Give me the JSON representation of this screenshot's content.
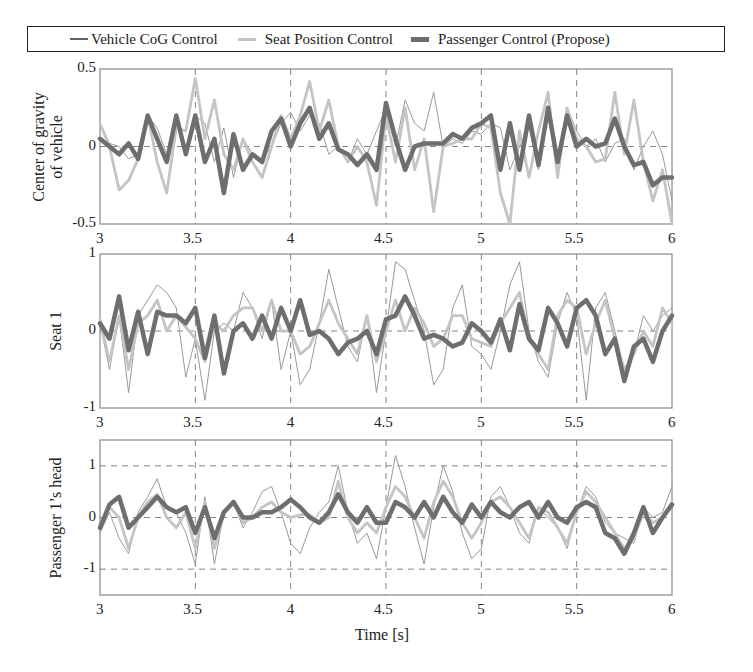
{
  "legend": {
    "items": [
      {
        "label": "Vehicle CoG Control",
        "color": "#909090",
        "width": 1
      },
      {
        "label": "Seat Position Control",
        "color": "#c4c4c4",
        "width": 2.5
      },
      {
        "label": "Passenger Control  (Propose)",
        "color": "#6e6e6e",
        "width": 4.5
      }
    ]
  },
  "chart_data": [
    {
      "type": "line",
      "title": "",
      "xlabel": "",
      "ylabel": "Center of gravity of vehicle",
      "ylabel_lines": [
        "Center of gravity",
        "of vehicle"
      ],
      "xlim": [
        3,
        6
      ],
      "ylim": [
        -0.5,
        0.5
      ],
      "yticks": [
        0.5,
        0,
        -0.5
      ],
      "ytick_labels": [
        "0.5",
        "0",
        "-0.5"
      ],
      "xticks": [
        3,
        3.5,
        4,
        4.5,
        5,
        5.5,
        6
      ],
      "xtick_labels": [
        "3",
        "3.5",
        "4",
        "4.5",
        "5",
        "5.5",
        "6"
      ],
      "hgrid": [
        0
      ],
      "vgrid": [
        3.5,
        4,
        4.5,
        5,
        5.5
      ],
      "x": [
        3.0,
        3.05,
        3.1,
        3.15,
        3.2,
        3.25,
        3.3,
        3.35,
        3.4,
        3.45,
        3.5,
        3.55,
        3.6,
        3.65,
        3.7,
        3.75,
        3.8,
        3.85,
        3.9,
        3.95,
        4.0,
        4.05,
        4.1,
        4.15,
        4.2,
        4.25,
        4.3,
        4.35,
        4.4,
        4.45,
        4.5,
        4.55,
        4.6,
        4.65,
        4.7,
        4.75,
        4.8,
        4.85,
        4.9,
        4.95,
        5.0,
        5.05,
        5.1,
        5.15,
        5.2,
        5.25,
        5.3,
        5.35,
        5.4,
        5.45,
        5.5,
        5.55,
        5.6,
        5.65,
        5.7,
        5.75,
        5.8,
        5.85,
        5.9,
        5.95,
        6.0
      ],
      "series": [
        {
          "name": "Vehicle CoG Control",
          "values": [
            0.15,
            0.02,
            0.0,
            -0.08,
            -0.05,
            0.2,
            0.12,
            -0.05,
            0.2,
            -0.02,
            0.2,
            0.15,
            -0.1,
            0.12,
            -0.2,
            0.05,
            -0.05,
            -0.08,
            0.0,
            0.15,
            0.22,
            0.1,
            0.2,
            0.15,
            -0.05,
            0.0,
            -0.1,
            0.05,
            -0.05,
            0.1,
            0.25,
            0.0,
            0.3,
            0.15,
            0.1,
            0.35,
            0.0,
            0.05,
            0.02,
            0.1,
            0.08,
            0.15,
            0.12,
            -0.15,
            0.0,
            0.12,
            -0.15,
            0.2,
            -0.1,
            0.25,
            0.1,
            0.0,
            0.05,
            -0.1,
            0.02,
            0.05,
            -0.15,
            0.0,
            0.1,
            -0.05,
            -0.35
          ]
        },
        {
          "name": "Seat Position Control",
          "values": [
            0.15,
            0.0,
            -0.28,
            -0.22,
            -0.08,
            0.2,
            -0.1,
            -0.3,
            0.12,
            0.1,
            0.44,
            0.05,
            0.3,
            -0.05,
            -0.15,
            0.05,
            -0.1,
            -0.2,
            0.0,
            0.2,
            0.05,
            0.2,
            0.42,
            0.1,
            0.3,
            0.0,
            -0.1,
            0.0,
            -0.1,
            -0.38,
            0.2,
            -0.1,
            0.25,
            -0.15,
            0.05,
            -0.42,
            0.0,
            0.02,
            0.05,
            0.05,
            0.15,
            0.12,
            -0.3,
            -0.55,
            0.1,
            -0.2,
            0.1,
            0.35,
            -0.2,
            0.25,
            0.05,
            0.0,
            -0.1,
            -0.08,
            0.35,
            -0.05,
            0.3,
            -0.1,
            -0.35,
            -0.15,
            -0.55
          ]
        },
        {
          "name": "Passenger Control (Propose)",
          "values": [
            0.05,
            0.0,
            -0.05,
            0.02,
            -0.08,
            0.2,
            0.05,
            -0.1,
            0.2,
            -0.05,
            0.2,
            -0.1,
            0.05,
            -0.3,
            0.08,
            -0.15,
            -0.05,
            -0.1,
            0.1,
            0.18,
            0.0,
            0.15,
            0.25,
            0.05,
            0.15,
            -0.02,
            -0.05,
            -0.12,
            -0.05,
            -0.15,
            0.28,
            0.05,
            -0.15,
            0.0,
            0.02,
            0.02,
            0.02,
            0.08,
            0.05,
            0.12,
            0.15,
            0.2,
            -0.15,
            0.15,
            -0.15,
            0.2,
            -0.12,
            0.25,
            -0.1,
            0.2,
            0.0,
            0.05,
            0.0,
            0.02,
            0.18,
            0.0,
            -0.12,
            -0.1,
            -0.25,
            -0.2,
            -0.2
          ]
        }
      ]
    },
    {
      "type": "line",
      "title": "",
      "xlabel": "",
      "ylabel": "Seat 1",
      "ylabel_lines": [
        "Seat 1"
      ],
      "xlim": [
        3,
        6
      ],
      "ylim": [
        -1,
        1
      ],
      "yticks": [
        1,
        0,
        -1
      ],
      "ytick_labels": [
        "1",
        "0",
        "-1"
      ],
      "xticks": [
        3,
        3.5,
        4,
        4.5,
        5,
        5.5,
        6
      ],
      "xtick_labels": [
        "3",
        "3.5",
        "4",
        "4.5",
        "5",
        "5.5",
        "6"
      ],
      "hgrid": [
        0
      ],
      "vgrid": [
        3.5,
        4,
        4.5,
        5,
        5.5
      ],
      "x": [
        3.0,
        3.05,
        3.1,
        3.15,
        3.2,
        3.25,
        3.3,
        3.35,
        3.4,
        3.45,
        3.5,
        3.55,
        3.6,
        3.65,
        3.7,
        3.75,
        3.8,
        3.85,
        3.9,
        3.95,
        4.0,
        4.05,
        4.1,
        4.15,
        4.2,
        4.25,
        4.3,
        4.35,
        4.4,
        4.45,
        4.5,
        4.55,
        4.6,
        4.65,
        4.7,
        4.75,
        4.8,
        4.85,
        4.9,
        4.95,
        5.0,
        5.05,
        5.1,
        5.15,
        5.2,
        5.25,
        5.3,
        5.35,
        5.4,
        5.45,
        5.5,
        5.55,
        5.6,
        5.65,
        5.7,
        5.75,
        5.8,
        5.85,
        5.9,
        5.95,
        6.0
      ],
      "series": [
        {
          "name": "Vehicle CoG Control",
          "values": [
            0.1,
            -0.5,
            0.2,
            -0.8,
            0.2,
            0.4,
            0.6,
            0.5,
            0.3,
            -0.6,
            -0.1,
            -0.9,
            0.0,
            0.1,
            0.0,
            0.5,
            0.3,
            -0.1,
            0.4,
            -0.5,
            0.0,
            -0.7,
            -0.5,
            0.1,
            0.8,
            0.3,
            -0.2,
            -0.4,
            0.2,
            -0.8,
            0.0,
            0.9,
            0.8,
            0.4,
            0.0,
            -0.7,
            -0.5,
            0.3,
            0.6,
            -0.2,
            -0.3,
            -0.5,
            0.0,
            0.6,
            0.9,
            0.0,
            -0.4,
            -0.6,
            0.1,
            0.5,
            0.2,
            -0.9,
            0.3,
            0.5,
            0.0,
            -0.5,
            -0.3,
            0.2,
            0.0,
            0.2,
            0.3
          ]
        },
        {
          "name": "Seat Position Control",
          "values": [
            0.15,
            -0.4,
            0.2,
            -0.5,
            0.1,
            0.2,
            0.4,
            0.0,
            0.2,
            0.05,
            -0.1,
            -0.4,
            0.1,
            0.0,
            0.2,
            0.3,
            0.3,
            0.0,
            0.4,
            0.0,
            0.0,
            -0.3,
            -0.2,
            0.1,
            0.4,
            0.1,
            -0.1,
            -0.3,
            0.2,
            -0.4,
            0.0,
            0.4,
            0.0,
            0.3,
            0.1,
            -0.2,
            -0.1,
            0.2,
            0.2,
            -0.1,
            -0.15,
            -0.2,
            0.1,
            0.3,
            0.5,
            -0.1,
            -0.3,
            -0.5,
            0.2,
            0.4,
            0.3,
            -0.3,
            0.1,
            0.4,
            -0.1,
            -0.5,
            -0.3,
            0.0,
            -0.2,
            0.3,
            0.1
          ]
        },
        {
          "name": "Passenger Control (Propose)",
          "values": [
            0.1,
            -0.1,
            0.45,
            -0.25,
            0.25,
            -0.3,
            0.25,
            0.2,
            0.2,
            0.1,
            0.3,
            -0.35,
            0.2,
            -0.55,
            0.0,
            0.1,
            -0.1,
            0.2,
            -0.1,
            0.3,
            0.0,
            0.4,
            -0.05,
            0.0,
            -0.1,
            -0.3,
            -0.15,
            -0.1,
            0.0,
            -0.3,
            0.15,
            0.2,
            0.45,
            0.2,
            -0.1,
            -0.05,
            -0.1,
            -0.2,
            -0.15,
            0.1,
            0.0,
            -0.15,
            0.15,
            -0.25,
            0.35,
            -0.1,
            -0.25,
            0.3,
            0.1,
            -0.2,
            0.3,
            0.4,
            0.2,
            -0.3,
            -0.1,
            -0.65,
            -0.2,
            -0.1,
            -0.4,
            0.0,
            0.2
          ]
        }
      ]
    },
    {
      "type": "line",
      "title": "",
      "xlabel": "Time [s]",
      "ylabel": "Passenger 1’s head",
      "ylabel_lines": [
        "Passenger 1’s head"
      ],
      "xlim": [
        3,
        6
      ],
      "ylim": [
        -1.5,
        1.5
      ],
      "yticks": [
        1,
        0,
        -1
      ],
      "ytick_labels": [
        "1",
        "0",
        "-1"
      ],
      "xticks": [
        3,
        3.5,
        4,
        4.5,
        5,
        5.5,
        6
      ],
      "xtick_labels": [
        "3",
        "3.5",
        "4",
        "4.5",
        "5",
        "5.5",
        "6"
      ],
      "hgrid": [
        1,
        0,
        -1
      ],
      "vgrid": [
        3.5,
        4,
        4.5,
        5,
        5.5
      ],
      "x": [
        3.0,
        3.05,
        3.1,
        3.15,
        3.2,
        3.25,
        3.3,
        3.35,
        3.4,
        3.45,
        3.5,
        3.55,
        3.6,
        3.65,
        3.7,
        3.75,
        3.8,
        3.85,
        3.9,
        3.95,
        4.0,
        4.05,
        4.1,
        4.15,
        4.2,
        4.25,
        4.3,
        4.35,
        4.4,
        4.45,
        4.5,
        4.55,
        4.6,
        4.65,
        4.7,
        4.75,
        4.8,
        4.85,
        4.9,
        4.95,
        5.0,
        5.05,
        5.1,
        5.15,
        5.2,
        5.25,
        5.3,
        5.35,
        5.4,
        5.45,
        5.5,
        5.55,
        5.6,
        5.65,
        5.7,
        5.75,
        5.8,
        5.85,
        5.9,
        5.95,
        6.0
      ],
      "series": [
        {
          "name": "Vehicle CoG Control",
          "values": [
            -0.3,
            0.1,
            -0.4,
            -0.7,
            0.1,
            0.4,
            0.75,
            0.2,
            0.1,
            -0.3,
            -0.9,
            0.4,
            -0.9,
            0.1,
            0.3,
            -0.2,
            0.1,
            0.5,
            0.6,
            0.1,
            -0.5,
            -0.7,
            -0.2,
            0.1,
            0.3,
            1.0,
            0.1,
            -0.5,
            -0.3,
            -0.8,
            0.2,
            1.2,
            0.6,
            -0.2,
            -0.9,
            0.2,
            1.0,
            0.5,
            -0.3,
            -0.8,
            -0.6,
            0.4,
            0.6,
            0.2,
            -0.3,
            -0.5,
            0.2,
            0.0,
            -0.2,
            -0.6,
            0.1,
            0.6,
            0.4,
            -0.1,
            -0.3,
            -0.4,
            -0.5,
            0.2,
            0.0,
            0.1,
            0.6
          ]
        },
        {
          "name": "Seat Position Control",
          "values": [
            -0.2,
            0.2,
            0.0,
            -0.6,
            0.0,
            0.3,
            0.45,
            0.0,
            -0.2,
            0.1,
            -0.6,
            0.3,
            -0.6,
            0.1,
            0.3,
            -0.1,
            0.0,
            0.2,
            0.3,
            0.1,
            0.0,
            0.05,
            0.05,
            -0.1,
            0.0,
            0.7,
            0.0,
            -0.3,
            -0.1,
            -0.3,
            0.2,
            0.6,
            0.4,
            0.0,
            -0.4,
            0.3,
            0.7,
            0.4,
            -0.1,
            -0.4,
            -0.1,
            0.3,
            0.4,
            0.2,
            -0.1,
            -0.4,
            0.2,
            0.1,
            -0.2,
            -0.5,
            0.1,
            0.5,
            0.3,
            0.0,
            -0.3,
            -0.6,
            -0.4,
            0.1,
            -0.1,
            0.0,
            0.3
          ]
        },
        {
          "name": "Passenger Control (Propose)",
          "values": [
            -0.2,
            0.25,
            0.4,
            -0.2,
            0.0,
            0.2,
            0.4,
            0.2,
            0.1,
            0.2,
            -0.3,
            0.2,
            -0.4,
            0.1,
            0.3,
            0.0,
            0.0,
            0.1,
            0.1,
            0.2,
            0.35,
            0.2,
            0.0,
            -0.1,
            0.1,
            0.45,
            0.1,
            -0.1,
            0.2,
            -0.1,
            -0.1,
            0.3,
            0.2,
            0.0,
            0.3,
            0.0,
            0.4,
            0.1,
            -0.1,
            0.25,
            0.0,
            0.3,
            0.1,
            0.0,
            0.2,
            0.3,
            0.0,
            0.3,
            0.0,
            -0.1,
            0.2,
            0.3,
            0.2,
            -0.3,
            -0.4,
            -0.7,
            -0.3,
            0.2,
            -0.3,
            0.0,
            0.25
          ]
        }
      ]
    }
  ]
}
